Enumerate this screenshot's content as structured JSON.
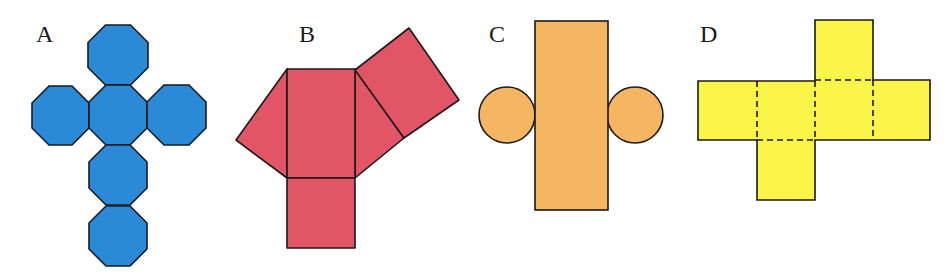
{
  "figures": [
    {
      "label": "A",
      "shape": "net of octagonal prism (six octagons in cross)",
      "fill": "#2b8ad8"
    },
    {
      "label": "B",
      "shape": "net of triangular prism",
      "fill": "#e15566"
    },
    {
      "label": "C",
      "shape": "net of cylinder",
      "fill": "#f5b661"
    },
    {
      "label": "D",
      "shape": "net of cube with dashed fold lines",
      "fill": "#fbf54a"
    }
  ],
  "colors": {
    "stroke": "#1a1a1a",
    "background": "#ffffff"
  }
}
